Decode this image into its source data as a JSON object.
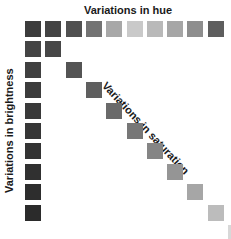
{
  "labels": {
    "hue": "Variations in hue",
    "brightness": "Variations in brightness",
    "saturation": "Variations in saturation"
  },
  "grid": {
    "origin_x": 25,
    "origin_y": 21,
    "step_x": 20.3,
    "step_y": 20.4,
    "size": 16
  },
  "hue_row": [
    "#3c3c3c",
    "#444444",
    "#505050",
    "#737373",
    "#a8a8a8",
    "#c9c9c9",
    "#b9b9b9",
    "#a6a6a6",
    "#8e8e8e",
    "#5e5e5e"
  ],
  "brightness_column": [
    "#444444",
    "#404040",
    "#3c3c3c",
    "#393939",
    "#363636",
    "#333333",
    "#303030",
    "#2d2d2d",
    "#2b2b2b"
  ],
  "saturation_diagonal": [
    "#474747",
    "#545454",
    "#5f5f5f",
    "#6a6a6a",
    "#777777",
    "#858585",
    "#959595",
    "#a6a6a6",
    "#bcbcbc",
    "#d8d8d8"
  ]
}
